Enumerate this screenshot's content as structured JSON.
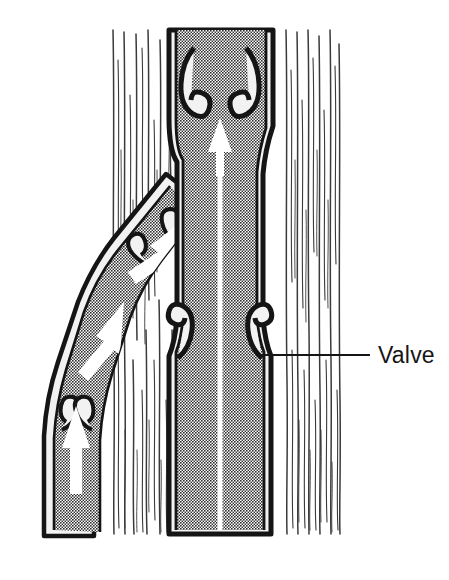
{
  "figure": {
    "type": "anatomical-diagram",
    "background_color": "#ffffff",
    "ink_color": "#151515",
    "lumen_fill_color": "#6e6e6e",
    "vessel_wall_color": "#f2f2f2",
    "muscle_fiber_color": "#3a3a3a"
  },
  "labels": [
    {
      "id": "valve-label",
      "text": "Valve",
      "text_x": 378,
      "text_y": 362,
      "leader_from_x": 258,
      "leader_from_y": 355,
      "leader_to_x": 370,
      "leader_to_y": 355,
      "color": "#151515"
    }
  ],
  "blood_flow": {
    "direction": "upward toward the heart",
    "arrow_color": "#ffffff",
    "arrows": [
      {
        "id": "main-trunk-arrow",
        "location": "central main vein",
        "points": "up"
      },
      {
        "id": "branch-upper-arrow",
        "location": "diagonal branch vein",
        "points": "up-right"
      },
      {
        "id": "branch-mid-arrow",
        "location": "mid diagonal branch",
        "points": "up-right"
      },
      {
        "id": "branch-lower-arrow",
        "location": "lower vertical branch",
        "points": "up"
      }
    ]
  },
  "valves": [
    {
      "id": "valve-main-upper",
      "location": "main vein, upper",
      "cusps": 2,
      "state": "open"
    },
    {
      "id": "valve-main-lower",
      "location": "main vein, lower (labeled)",
      "cusps": 2,
      "state": "open"
    },
    {
      "id": "valve-branch-upper",
      "location": "branch vein junction",
      "cusps": 2,
      "state": "open"
    },
    {
      "id": "valve-branch-lower",
      "location": "lower branch vein",
      "cusps": 2,
      "state": "open"
    }
  ],
  "muscle": {
    "id": "skeletal-muscle-fibers",
    "description": "Vertical striated muscle fibers surrounding the vein",
    "left_edge": 110,
    "right_edge": 342
  }
}
